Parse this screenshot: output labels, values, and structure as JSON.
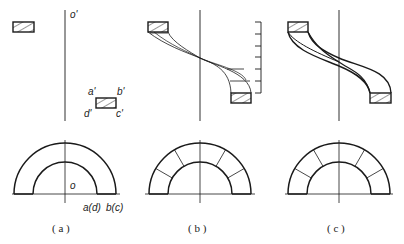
{
  "figure": {
    "panels": [
      {
        "id": "a",
        "caption": "( a )",
        "labels": {
          "axis_top": "o'",
          "corner_a": "a'",
          "corner_b": "b'",
          "corner_c": "c'",
          "corner_d": "d'",
          "center": "o",
          "baseline_inner": "a(d)",
          "baseline_outer": "b(c)"
        }
      },
      {
        "id": "b",
        "caption": "( b )",
        "scale_ticks": 8
      },
      {
        "id": "c",
        "caption": "( c )"
      }
    ],
    "colors": {
      "line": "#1a1a1a",
      "background": "#ffffff"
    }
  }
}
